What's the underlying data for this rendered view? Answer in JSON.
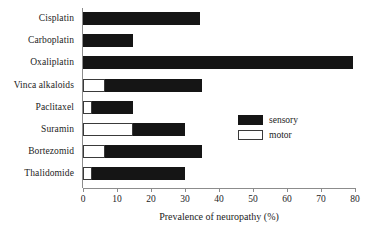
{
  "chart_data": {
    "type": "bar",
    "orientation": "horizontal",
    "title": "",
    "xlabel": "Prevalence of neuropathy (%)",
    "ylabel": "",
    "xlim": [
      0,
      80
    ],
    "xticks": [
      0,
      10,
      20,
      30,
      40,
      50,
      60,
      70,
      80
    ],
    "xticklabels": [
      "0",
      "10",
      "20",
      "30",
      "40",
      "50",
      "60",
      "70",
      "80"
    ],
    "grid": false,
    "legend_position": "center-right",
    "categories": [
      "Cisplatin",
      "Carboplatin",
      "Oxaliplatin",
      "Vinca alkaloids",
      "Paclitaxel",
      "Suramin",
      "Bortezomid",
      "Thalidomide"
    ],
    "series": [
      {
        "name": "sensory",
        "color": "#151515",
        "values": [
          34.5,
          14.7,
          79.5,
          35.0,
          14.7,
          30.0,
          35.0,
          30.0
        ]
      },
      {
        "name": "motor",
        "color": "#ffffff",
        "values": [
          0,
          0,
          0,
          6.5,
          2.5,
          14.7,
          6.5,
          2.5
        ]
      }
    ]
  },
  "legend": {
    "items": [
      {
        "label": "sensory",
        "swatch": "sensory"
      },
      {
        "label": "motor",
        "swatch": "motor"
      }
    ]
  }
}
